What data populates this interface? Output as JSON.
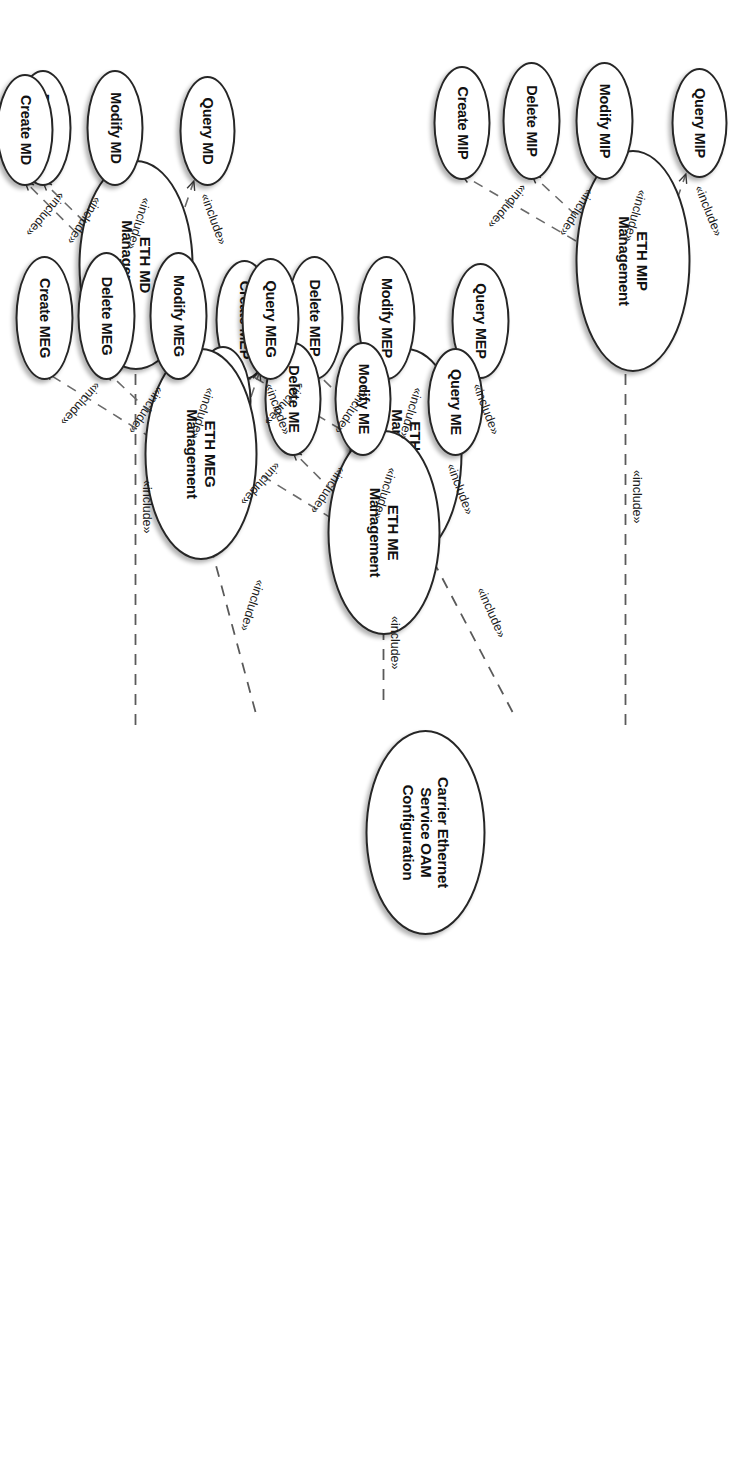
{
  "diagram": {
    "type": "uml-use-case-diagram",
    "title": "Carrier Ethernet Service OAM Configuration",
    "orientation": "rotated-90-clockwise",
    "stereotype_label": "«include»",
    "colors": {
      "stroke": "#262626",
      "fill": "#ffffff",
      "text": "#111111",
      "edge": "#4d4d4d"
    },
    "root": {
      "id": "root",
      "label": "Carrier Ethernet\nService OAM\nConfiguration",
      "line1": "Carrier Ethernet",
      "line2": "Service OAM",
      "line3": "Configuration"
    },
    "groups": [
      {
        "id": "eth-mip-management",
        "label": "ETH MIP\nManagement",
        "line1": "ETH MIP",
        "line2": "Management",
        "children": [
          {
            "id": "create-mip",
            "label": "Create MIP"
          },
          {
            "id": "query-mip",
            "label": "Query MIP"
          },
          {
            "id": "modify-mip",
            "label": "Modify MIP"
          },
          {
            "id": "delete-mip",
            "label": "Delete MIP"
          }
        ]
      },
      {
        "id": "eth-mep-management",
        "label": "ETH MEP\nManagement",
        "line1": "ETH MEP",
        "line2": "Management",
        "children": [
          {
            "id": "create-mep",
            "label": "Create MEP"
          },
          {
            "id": "query-mep",
            "label": "Query MEP"
          },
          {
            "id": "modify-mep",
            "label": "Modify MEP"
          },
          {
            "id": "delete-mep",
            "label": "Delete MEP"
          }
        ]
      },
      {
        "id": "eth-me-management",
        "label": "ETH ME\nManagement",
        "line1": "ETH ME",
        "line2": "Management",
        "children": [
          {
            "id": "create-me",
            "label": "Create ME"
          },
          {
            "id": "query-me",
            "label": "Query ME"
          },
          {
            "id": "modify-me",
            "label": "Modify ME"
          },
          {
            "id": "delete-me",
            "label": "Delete ME"
          }
        ]
      },
      {
        "id": "eth-md-management",
        "label": "ETH MD\nManagement",
        "line1": "ETH MD",
        "line2": "Management",
        "children": [
          {
            "id": "create-md",
            "label": "Create MD"
          },
          {
            "id": "query-md",
            "label": "Query MD"
          },
          {
            "id": "modify-md",
            "label": "Modify MD"
          },
          {
            "id": "delete-md",
            "label": "Delete MD"
          }
        ]
      },
      {
        "id": "eth-meg-management",
        "label": "ETH MEG\nManagement",
        "line1": "ETH MEG",
        "line2": "Management",
        "children": [
          {
            "id": "create-meg",
            "label": "Create MEG"
          },
          {
            "id": "query-meg",
            "label": "Query MEG"
          },
          {
            "id": "modify-meg",
            "label": "Modify MEG"
          },
          {
            "id": "delete-meg",
            "label": "Delete MEG"
          }
        ]
      }
    ],
    "edge_labels": {
      "root_to_mip": "«include»",
      "root_to_mep": "«include»",
      "root_to_me": "«include»",
      "root_to_md": "«include»",
      "root_to_meg": "«include»",
      "mip_create": "«include»",
      "mip_query": "«include»",
      "mip_modify": "«include»",
      "mip_delete": "«include»",
      "mep_create": "«include»",
      "mep_query": "«include»",
      "mep_modify": "«include»",
      "mep_delete": "«include»",
      "me_create": "«include»",
      "me_query": "«include»",
      "me_modify": "«include»",
      "me_delete": "«include»",
      "md_create": "«include»",
      "md_query": "«include»",
      "md_modify": "«include»",
      "md_delete": "«include»",
      "meg_create": "«include»",
      "meg_query": "«include»",
      "meg_modify": "«include»",
      "meg_delete": "«include»"
    }
  }
}
